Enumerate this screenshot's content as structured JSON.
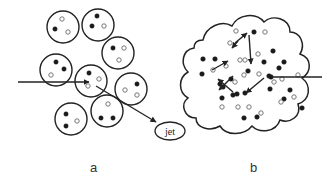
{
  "diagram": {
    "panels": [
      {
        "id": "a",
        "caption": "a",
        "description": "Discrete nucleons (circles) each containing three quarks; an incoming arrow strikes a quark which exits as a jet",
        "nucleon_count": 9,
        "output_label": "jet"
      },
      {
        "id": "b",
        "caption": "b",
        "description": "Deconfined quark-gluon plasma cloud with many quarks; incoming arrow scatters among quarks"
      }
    ],
    "legend": {
      "filled_dot": "quark (dark)",
      "open_dot": "quark (light)"
    },
    "colors": {
      "stroke": "#222222",
      "filled": "#1a1a1a",
      "open_stroke": "#777777",
      "background": "#ffffff"
    }
  }
}
